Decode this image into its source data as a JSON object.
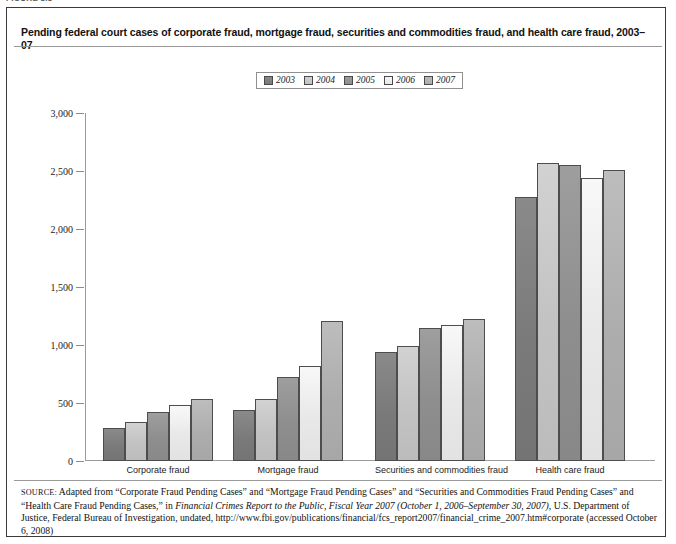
{
  "figure_label": "FIGURE 8.3",
  "chart_title": "Pending federal court cases of corporate fraud, mortgage fraud, securities and commodities fraud, and health care fraud, 2003–07",
  "legend": {
    "items": [
      {
        "label": "2003",
        "color": "#7a7a7a"
      },
      {
        "label": "2004",
        "color": "#c2c2c2"
      },
      {
        "label": "2005",
        "color": "#8e8e8e"
      },
      {
        "label": "2006",
        "color": "#e8e8e8"
      },
      {
        "label": "2007",
        "color": "#adadad"
      }
    ]
  },
  "axis": {
    "y_ticks": [
      "3,000",
      "2,500",
      "2,000",
      "1,500",
      "1,000",
      "500",
      "0"
    ],
    "y_min": 0,
    "y_max": 3000,
    "y_step": 500
  },
  "source_note": {
    "label": "SOURCE:",
    "line1": " Adapted from “Corporate Fraud Pending Cases” and “Mortgage Fraud Pending Cases” and “Securities and Commodities Fraud Pending Cases” and “Health Care Fraud Pending Cases,” in ",
    "italic1": "Financial Crimes Report to the Public, Fiscal Year 2007 (October 1, 2006–September 30, 2007),",
    "line2": " U.S. Department of Justice, Federal Bureau of Investigation, undated, http://www.fbi.gov/publications/financial/fcs_report2007/financial_crime_2007.htm#corporate (accessed October 6, 2008)"
  },
  "chart_data": {
    "type": "bar",
    "title": "Pending federal court cases of corporate fraud, mortgage fraud, securities and commodities fraud, and health care fraud, 2003–07",
    "xlabel": "",
    "ylabel": "",
    "ylim": [
      0,
      3000
    ],
    "grid": false,
    "legend_position": "top-center",
    "categories": [
      "Corporate fraud",
      "Mortgage fraud",
      "Securities and commodities fraud",
      "Health care fraud"
    ],
    "series": [
      {
        "name": "2003",
        "color": "#7a7a7a",
        "values": [
          282,
          436,
          941,
          2273
        ]
      },
      {
        "name": "2004",
        "color": "#c2c2c2",
        "values": [
          333,
          534,
          992,
          2571
        ]
      },
      {
        "name": "2005",
        "color": "#8e8e8e",
        "values": [
          424,
          721,
          1145,
          2552
        ]
      },
      {
        "name": "2006",
        "color": "#e8e8e8",
        "values": [
          487,
          818,
          1169,
          2437
        ]
      },
      {
        "name": "2007",
        "color": "#adadad",
        "values": [
          532,
          1204,
          1226,
          2509
        ]
      }
    ]
  }
}
